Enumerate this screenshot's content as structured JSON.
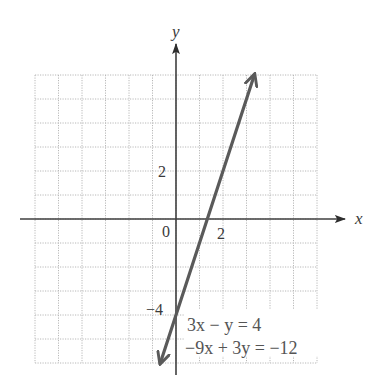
{
  "chart_data": {
    "type": "line",
    "title": "",
    "xlabel": "x",
    "ylabel": "y",
    "xlim": [
      -6,
      6
    ],
    "ylim": [
      -6,
      6
    ],
    "grid": true,
    "grid_style": "dotted",
    "tick_labels": {
      "origin": "0",
      "x": [
        {
          "value": 2,
          "label": "2"
        }
      ],
      "y": [
        {
          "value": 2,
          "label": "2"
        },
        {
          "value": -4,
          "label": "−4"
        }
      ]
    },
    "series": [
      {
        "name": "3x − y = 4",
        "equivalent": "−9x + 3y = −12",
        "slope": 3,
        "intercept": -4,
        "x": [
          -0.667,
          3.333
        ],
        "y": [
          -6,
          6
        ],
        "arrows": "both"
      }
    ],
    "annotations": [
      {
        "text": "3x − y = 4",
        "x": 0.5,
        "y": -4.6
      },
      {
        "text": "−9x + 3y = −12",
        "x": 0.4,
        "y": -5.6
      }
    ],
    "legend": "none"
  },
  "labels": {
    "x_axis": "x",
    "y_axis": "y",
    "origin": "0",
    "x_tick_2": "2",
    "y_tick_2": "2",
    "y_tick_neg4": "−4",
    "equation_1": "3x − y = 4",
    "equation_2": "−9x + 3y = −12"
  },
  "colors": {
    "axis": "#3f3f3f",
    "line": "#5a5a5a",
    "grid": "#b8b8b8",
    "background": "#ffffff"
  }
}
